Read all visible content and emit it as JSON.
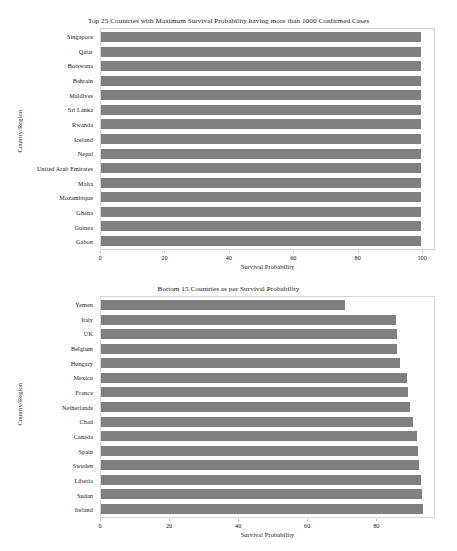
{
  "chart_data": [
    {
      "type": "bar",
      "orientation": "horizontal",
      "title": "Top 25 Countries with Maximum Survival Probability having more than 1000 Confirmed Cases",
      "xlabel": "Survival Probability",
      "ylabel": "Country/Region",
      "xlim": [
        0,
        104
      ],
      "xticks": [
        0,
        20,
        40,
        60,
        80,
        100
      ],
      "xticklabels": [
        "0",
        "20",
        "40",
        "60",
        "80",
        "100"
      ],
      "grid": false,
      "legend": "none",
      "bar_color": "#808080",
      "categories": [
        "Singapore",
        "Qatar",
        "Botswana",
        "Bahrain",
        "Maldives",
        "Sri Lanka",
        "Rwanda",
        "Iceland",
        "Nepal",
        "United Arab Emirates",
        "Malta",
        "Mozambique",
        "Ghana",
        "Guinea",
        "Gabon"
      ],
      "values": [
        100,
        100,
        100,
        100,
        100,
        100,
        100,
        100,
        100,
        100,
        100,
        100,
        100,
        100,
        100
      ]
    },
    {
      "type": "bar",
      "orientation": "horizontal",
      "title": "Bottom 15 Countries as per Survival Probability",
      "xlabel": "Survival Probability",
      "ylabel": "Country/Region",
      "xlim": [
        0,
        97
      ],
      "xticks": [
        0,
        20,
        40,
        60,
        80
      ],
      "xticklabels": [
        "0",
        "20",
        "40",
        "60",
        "80"
      ],
      "grid": false,
      "legend": "none",
      "bar_color": "#808080",
      "categories": [
        "Yemen",
        "Italy",
        "UK",
        "Belgium",
        "Hungary",
        "Mexico",
        "France",
        "Netherlands",
        "Chad",
        "Canada",
        "Spain",
        "Sweden",
        "Liberia",
        "Sudan",
        "Ireland"
      ],
      "values": [
        71.2,
        85.8,
        86.1,
        86.3,
        87.1,
        89.0,
        89.4,
        90.1,
        90.8,
        92.0,
        92.3,
        92.6,
        93.1,
        93.4,
        93.8
      ]
    }
  ]
}
